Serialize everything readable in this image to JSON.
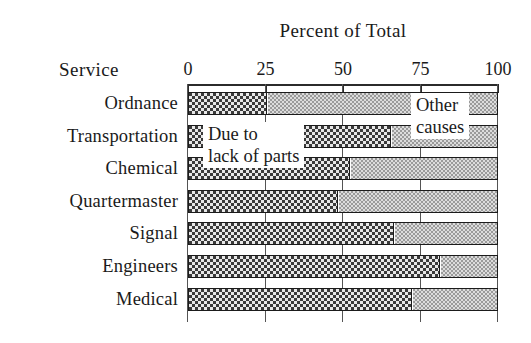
{
  "chart_data": {
    "type": "bar",
    "orientation": "horizontal",
    "stacked": true,
    "title": "Percent of Total",
    "xlabel": "Percent of Total",
    "ylabel": "Service",
    "xlim": [
      0,
      100
    ],
    "xticks": [
      0,
      25,
      50,
      75,
      100
    ],
    "xticklabels": [
      "0",
      "25",
      "50",
      "75",
      "100"
    ],
    "grid": true,
    "grid_axis": "x",
    "legend": "none",
    "categories": [
      "Ordnance",
      "Transportation",
      "Chemical",
      "Quartermaster",
      "Signal",
      "Engineers",
      "Medical"
    ],
    "series": [
      {
        "name": "Due to lack of parts",
        "values": [
          25,
          65,
          52,
          48,
          66,
          81,
          72
        ]
      },
      {
        "name": "Other causes",
        "values": [
          75,
          35,
          48,
          52,
          34,
          19,
          28
        ]
      }
    ],
    "annotations": [
      {
        "id": "parts",
        "line1": "Due to",
        "line2": "lack of parts"
      },
      {
        "id": "other",
        "line1": "Other",
        "line2": "causes"
      }
    ],
    "colors": {
      "parts_fill": "#3a3a3a",
      "other_fill": "#9a9a9a",
      "axis": "#2b2b2b",
      "background": "#ffffff"
    }
  }
}
